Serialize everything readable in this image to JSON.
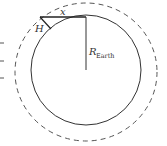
{
  "diagram": {
    "labels": {
      "x": "x",
      "H": "H",
      "R": "R",
      "R_sub": "Earth"
    },
    "colors": {
      "stroke": "#333333",
      "dashed": "#555555",
      "background": "#ffffff"
    }
  }
}
